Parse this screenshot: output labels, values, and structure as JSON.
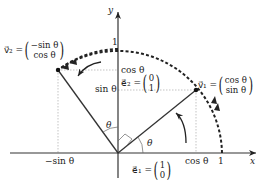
{
  "axes": {
    "x_label": "x",
    "y_label": "y"
  },
  "ticks": {
    "x_one": "1",
    "y_one": "1",
    "cos_x": "cos θ",
    "neg_sin_x": "−sin θ",
    "cos_y": "cos θ",
    "sin_y": "sin θ"
  },
  "angles": {
    "theta_1": "θ",
    "theta_2": "θ"
  },
  "vectors": {
    "e1": {
      "name": "e⃗₁ =",
      "top": "1",
      "bottom": "0"
    },
    "e2": {
      "name": "e⃗₂ =",
      "top": "0",
      "bottom": "1"
    },
    "v1": {
      "name": "v⃗₁ =",
      "top": "cos θ",
      "bottom": "sin θ"
    },
    "v2": {
      "name": "v⃗₂ =",
      "top": "−sin θ",
      "bottom": "cos θ"
    }
  }
}
